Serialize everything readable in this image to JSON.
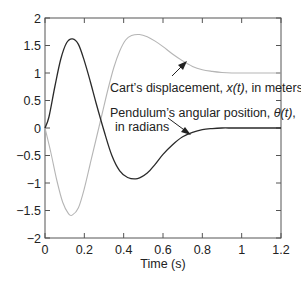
{
  "chart_data": {
    "type": "line",
    "title": "",
    "xlabel": "Time (s)",
    "ylabel": "",
    "xlim": [
      0,
      1.2
    ],
    "ylim": [
      -2,
      2
    ],
    "xticks": [
      0,
      0.2,
      0.4,
      0.6,
      0.8,
      1,
      1.2
    ],
    "xtick_labels": [
      "0",
      "0.2",
      "0.4",
      "0.6",
      "0.8",
      "1",
      "1.2"
    ],
    "yticks": [
      -2,
      -1.5,
      -1,
      -0.5,
      0,
      0.5,
      1,
      1.5,
      2
    ],
    "ytick_labels": [
      "−2",
      "−1.5",
      "−1",
      "−0.5",
      "0",
      "0.5",
      "1",
      "1.5",
      "2"
    ],
    "grid": false,
    "series": [
      {
        "name": "Cart's displacement, x(t), in meters",
        "color": "#b5b5b5",
        "x": [
          0,
          0.03,
          0.06,
          0.09,
          0.12,
          0.14,
          0.17,
          0.2,
          0.23,
          0.26,
          0.29,
          0.32,
          0.35,
          0.38,
          0.41,
          0.44,
          0.48,
          0.52,
          0.56,
          0.6,
          0.65,
          0.7,
          0.75,
          0.8,
          0.85,
          0.9,
          0.95,
          1.0,
          1.1,
          1.2
        ],
        "values": [
          0,
          -0.45,
          -0.95,
          -1.35,
          -1.56,
          -1.58,
          -1.45,
          -1.1,
          -0.65,
          -0.2,
          0.25,
          0.7,
          1.1,
          1.4,
          1.6,
          1.68,
          1.7,
          1.66,
          1.58,
          1.48,
          1.34,
          1.22,
          1.12,
          1.06,
          1.03,
          1.01,
          1.0,
          1.0,
          1.0,
          1.0
        ]
      },
      {
        "name": "Pendulum's angular position, θ(t), in radians",
        "color": "#2a2a2a",
        "x": [
          0,
          0.02,
          0.05,
          0.08,
          0.11,
          0.14,
          0.17,
          0.2,
          0.23,
          0.26,
          0.3,
          0.34,
          0.38,
          0.42,
          0.47,
          0.52,
          0.56,
          0.6,
          0.65,
          0.7,
          0.75,
          0.8,
          0.85,
          0.9,
          0.95,
          1.0,
          1.1,
          1.2
        ],
        "values": [
          0,
          0.2,
          0.75,
          1.25,
          1.55,
          1.62,
          1.52,
          1.22,
          0.85,
          0.45,
          -0.05,
          -0.5,
          -0.78,
          -0.9,
          -0.92,
          -0.82,
          -0.66,
          -0.48,
          -0.3,
          -0.16,
          -0.08,
          -0.03,
          -0.01,
          0,
          0,
          0,
          0,
          0
        ]
      }
    ],
    "annotations": [
      {
        "text_line1": "Cart’s displacement, ",
        "italic": "x(t)",
        "text_line1_end": ", in meters"
      },
      {
        "text_line1": "Pendulum’s angular position, ",
        "italic": "θ(t)",
        "text_line1_end": ",",
        "text_line2": "in radians"
      }
    ],
    "legend": "inline annotations with arrows"
  }
}
